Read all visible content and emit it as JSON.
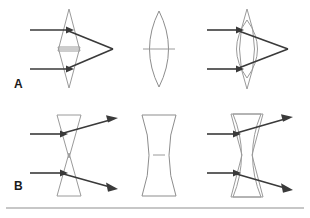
{
  "figure": {
    "background_color": "#ffffff",
    "width": 310,
    "height": 218,
    "lens_stroke_color": "#9a9a9a",
    "ray_color": "#3a3a3a",
    "rule_color": "#8f8f8f"
  },
  "rows": [
    {
      "label": "A",
      "label_x": 14,
      "label_y": 88,
      "lens_kind": "converging",
      "description": "Two prisms base-to-base act like a convex lens and converge parallel rays to a focal point",
      "panels": [
        {
          "name": "prism-pair-converging",
          "caption": "",
          "has_rays": true,
          "ray_direction": "converging"
        },
        {
          "name": "biconvex-lens",
          "caption": "",
          "has_rays": false,
          "ray_direction": "none"
        },
        {
          "name": "prism-pair-with-convex-lens",
          "caption": "",
          "has_rays": true,
          "ray_direction": "converging"
        }
      ]
    },
    {
      "label": "B",
      "label_x": 14,
      "label_y": 190,
      "lens_kind": "diverging",
      "description": "Two prisms apex-to-apex act like a concave lens and diverge parallel rays",
      "panels": [
        {
          "name": "prism-pair-diverging",
          "caption": "",
          "has_rays": true,
          "ray_direction": "diverging"
        },
        {
          "name": "biconcave-lens",
          "caption": "",
          "has_rays": false,
          "ray_direction": "none"
        },
        {
          "name": "prism-pair-with-concave-lens",
          "caption": "",
          "has_rays": true,
          "ray_direction": "diverging"
        }
      ]
    }
  ],
  "baseline_rule": {
    "name": "bottom-separator",
    "y": 208,
    "x_start": 6,
    "x_end": 304
  }
}
